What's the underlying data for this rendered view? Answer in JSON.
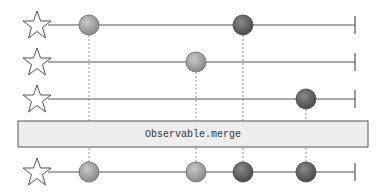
{
  "diagram": {
    "type": "marble-diagram",
    "operator_label": "Observable.merge",
    "colors": {
      "line": "#555555",
      "dashed": "#666666",
      "box_fill": "#eeeeee",
      "box_stroke": "#555555",
      "marble_light": "#9a9a9a",
      "marble_dark": "#5e5e5e"
    },
    "input_streams": [
      {
        "name": "stream-1",
        "marbles": [
          {
            "x": 89,
            "shade": "light"
          },
          {
            "x": 243,
            "shade": "dark"
          }
        ]
      },
      {
        "name": "stream-2",
        "marbles": [
          {
            "x": 196,
            "shade": "light"
          }
        ]
      },
      {
        "name": "stream-3",
        "marbles": [
          {
            "x": 306,
            "shade": "dark"
          }
        ]
      }
    ],
    "output_stream": {
      "name": "merged-output",
      "marbles": [
        {
          "x": 89,
          "shade": "light"
        },
        {
          "x": 196,
          "shade": "light"
        },
        {
          "x": 243,
          "shade": "dark"
        },
        {
          "x": 306,
          "shade": "dark"
        }
      ]
    }
  }
}
